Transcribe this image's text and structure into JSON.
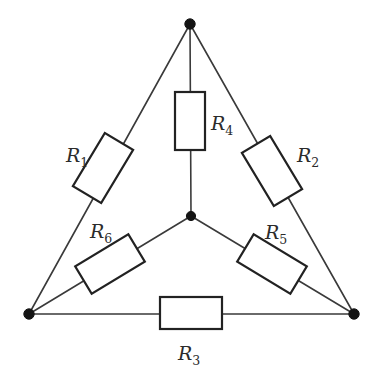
{
  "diagram": {
    "background_color": "#ffffff",
    "wire_color": "#3a3a3a",
    "box_stroke_color": "#222222",
    "box_fill_color": "#ffffff",
    "node_color": "#141414",
    "label_color": "#2b2b2b"
  },
  "nodes": [
    {
      "name": "top",
      "label": "",
      "x": 190,
      "y": 24,
      "r": 5.2
    },
    {
      "name": "center",
      "label": "",
      "x": 191,
      "y": 216,
      "r": 4.6
    },
    {
      "name": "bottom-left",
      "label": "",
      "x": 29,
      "y": 314,
      "r": 5.2
    },
    {
      "name": "bottom-right",
      "label": "",
      "x": 354,
      "y": 314,
      "r": 5.2
    }
  ],
  "resistors": [
    {
      "id": "R1",
      "letter": "R",
      "subscript": "1",
      "edge": "top-to-bottom-left",
      "label_x": 66,
      "label_y": 162,
      "box": {
        "cx": 103,
        "cy": 168,
        "w": 33,
        "h": 62,
        "angle": 31
      }
    },
    {
      "id": "R2",
      "letter": "R",
      "subscript": "2",
      "edge": "top-to-bottom-right",
      "label_x": 297,
      "label_y": 162,
      "box": {
        "cx": 272,
        "cy": 171,
        "w": 33,
        "h": 62,
        "angle": -31
      }
    },
    {
      "id": "R3",
      "letter": "R",
      "subscript": "3",
      "edge": "bottom-left-to-bottom-right",
      "label_x": 178,
      "label_y": 360,
      "box": {
        "cx": 191,
        "cy": 313,
        "w": 62,
        "h": 32,
        "angle": 0
      }
    },
    {
      "id": "R4",
      "letter": "R",
      "subscript": "4",
      "edge": "center-to-top",
      "label_x": 211,
      "label_y": 130,
      "box": {
        "cx": 190,
        "cy": 121,
        "w": 30,
        "h": 58,
        "angle": 0
      }
    },
    {
      "id": "R5",
      "letter": "R",
      "subscript": "5",
      "edge": "center-to-bottom-right",
      "label_x": 265,
      "label_y": 239,
      "box": {
        "cx": 272,
        "cy": 264,
        "w": 62,
        "h": 32,
        "angle": 31
      }
    },
    {
      "id": "R6",
      "letter": "R",
      "subscript": "6",
      "edge": "center-to-bottom-left",
      "label_x": 90,
      "label_y": 238,
      "box": {
        "cx": 110,
        "cy": 264,
        "w": 62,
        "h": 32,
        "angle": -31
      }
    }
  ],
  "wires": [
    {
      "name": "top-to-bottom-left",
      "x1": 190,
      "y1": 24,
      "x2": 29,
      "y2": 314
    },
    {
      "name": "top-to-bottom-right",
      "x1": 190,
      "y1": 24,
      "x2": 354,
      "y2": 314
    },
    {
      "name": "bottom-left-to-bottom-right",
      "x1": 29,
      "y1": 314,
      "x2": 354,
      "y2": 314
    },
    {
      "name": "center-to-top",
      "x1": 191,
      "y1": 216,
      "x2": 190,
      "y2": 24
    },
    {
      "name": "center-to-bottom-left",
      "x1": 191,
      "y1": 216,
      "x2": 29,
      "y2": 314
    },
    {
      "name": "center-to-bottom-right",
      "x1": 191,
      "y1": 216,
      "x2": 354,
      "y2": 314
    }
  ]
}
